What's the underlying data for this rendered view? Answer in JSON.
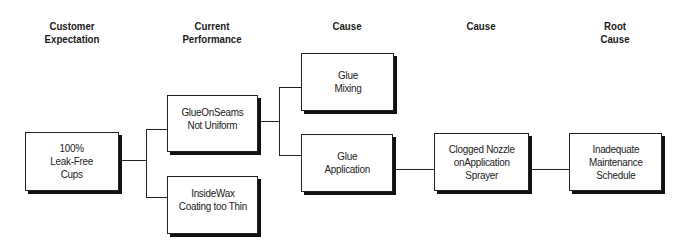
{
  "headers": {
    "col1": "Customer\nExpectation",
    "col2": "Current\nPerformance",
    "col3": "Cause",
    "col4": "Cause",
    "col5": "Root\nCause"
  },
  "nodes": {
    "expectation": "100%\nLeak-Free\nCups",
    "perf_glue": "GlueOnSeams\nNot Uniform",
    "perf_wax": "InsideWax\nCoating too Thin",
    "cause_mixing": "Glue\nMixing",
    "cause_application": "Glue\nApplication",
    "cause_nozzle": "Clogged Nozzle\nonApplication\nSprayer",
    "root_cause": "Inadequate\nMaintenance\nSchedule"
  }
}
